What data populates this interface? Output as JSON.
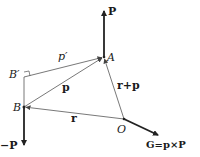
{
  "diagram": {
    "points": {
      "A": {
        "label": "A",
        "x": 104,
        "y": 57
      },
      "B": {
        "label": "B",
        "x": 24,
        "y": 107
      },
      "B_prime": {
        "label": "B′",
        "x": 24,
        "y": 77
      },
      "O": {
        "label": "O",
        "x": 124,
        "y": 119
      }
    },
    "vectors": {
      "P": {
        "label": "P",
        "from": "A",
        "to": [
          104,
          10
        ]
      },
      "neg_P": {
        "label": "−P",
        "from": "B",
        "to": [
          24,
          145
        ]
      },
      "r": {
        "label": "r",
        "from": "O",
        "to": "B"
      },
      "p": {
        "label": "p",
        "from": "B",
        "to": "A"
      },
      "p_prime": {
        "label": "p′",
        "from": "B_prime",
        "to": "A"
      },
      "r_plus_p": {
        "label": "r+p",
        "from": "O",
        "to": "A"
      },
      "G": {
        "label": "G=p×P",
        "from": "O",
        "to": [
          158,
          135
        ]
      }
    },
    "right_angle_marker_at": "B_prime"
  }
}
